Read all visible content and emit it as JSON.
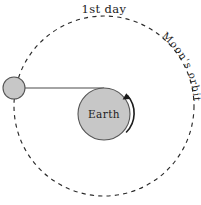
{
  "diagram": {
    "canvas": {
      "width": 201,
      "height": 205,
      "background": "#ffffff"
    },
    "labels": {
      "day": "1st day",
      "earth": "Earth",
      "orbit": "Moon's orbit"
    },
    "colors": {
      "body_fill": "#c7c7c7",
      "body_stroke": "#555555",
      "orbit_stroke": "#2b2b2b",
      "connector_stroke": "#4a4a4a",
      "arrow": "#1c1c1c",
      "text": "#1c1c1c"
    },
    "orbit": {
      "center_x": 104,
      "center_y": 106,
      "radius": 90,
      "style": "dashed",
      "dash": "4.2 4.2"
    },
    "earth": {
      "center_x": 104,
      "center_y": 114,
      "radius": 26,
      "fill": "#c7c7c7"
    },
    "moon": {
      "center_x": 14,
      "center_y": 88,
      "radius": 11,
      "fill": "#c7c7c7"
    },
    "connector": {
      "x1": 14,
      "y1": 88,
      "x2": 104,
      "y2": 88
    },
    "rotation_arrow": {
      "direction": "counterclockwise",
      "description": "Earth rotation arrow"
    }
  }
}
